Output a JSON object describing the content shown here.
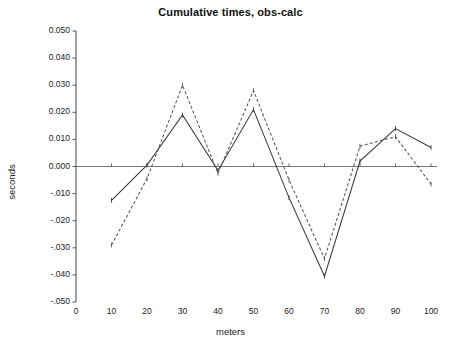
{
  "chart_data": {
    "type": "line",
    "title": "Cumulative times, obs-calc",
    "xlabel": "meters",
    "ylabel": "seconds",
    "x": [
      10,
      20,
      30,
      40,
      50,
      60,
      70,
      80,
      90,
      100
    ],
    "xlim": [
      0,
      100
    ],
    "ylim": [
      -0.05,
      0.05
    ],
    "xticks": [
      0,
      10,
      20,
      30,
      40,
      50,
      60,
      70,
      80,
      90,
      100
    ],
    "xtick_labels": [
      "0",
      "10",
      "20",
      "30",
      "40",
      "50",
      "60",
      "70",
      "80",
      "90",
      "100"
    ],
    "yticks": [
      0.05,
      0.04,
      0.03,
      0.02,
      0.01,
      0.0,
      -0.01,
      -0.02,
      -0.03,
      -0.04,
      -0.05
    ],
    "ytick_labels": [
      "0.050",
      "0.040",
      "0.030",
      "0.020",
      "0.010",
      "0.000",
      "-.010",
      "-.020",
      "-.030",
      "-.040",
      "-.050"
    ],
    "grid": false,
    "legend": "none",
    "zero_line": true,
    "series": [
      {
        "name": "series-solid",
        "style": "solid",
        "color": "#3a3a3a",
        "marker": "tick",
        "values": [
          -0.0125,
          0.0005,
          0.019,
          -0.0015,
          0.021,
          -0.0115,
          -0.0405,
          0.002,
          0.014,
          0.007
        ]
      },
      {
        "name": "series-dashed",
        "style": "dashed",
        "color": "#555555",
        "marker": "tick",
        "values": [
          -0.029,
          -0.0045,
          0.03,
          -0.0025,
          0.028,
          -0.005,
          -0.034,
          0.0075,
          0.011,
          -0.0065
        ]
      }
    ]
  },
  "axis": {
    "spine_color": "#555555",
    "zero_line_color": "#777777",
    "tick_color": "#555555"
  }
}
